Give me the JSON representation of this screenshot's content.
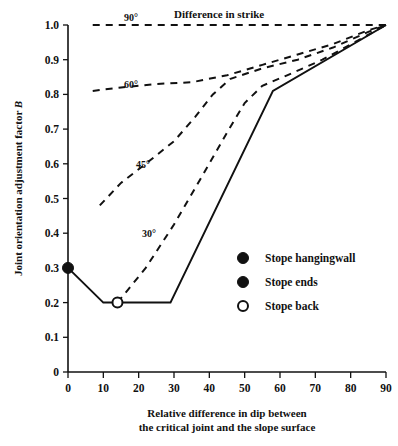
{
  "chart_data": {
    "type": "line",
    "title": "",
    "xlabel": "Relative difference in dip between\nthe critical joint and the slope surface",
    "ylabel": "Joint orientation adjustment factor B",
    "xlim": [
      0,
      90
    ],
    "ylim": [
      0,
      1.0
    ],
    "xticks": [
      "0",
      "10",
      "20",
      "30",
      "40",
      "50",
      "60",
      "70",
      "80",
      "90"
    ],
    "yticks": [
      "0",
      "0.1",
      "0.2",
      "0.3",
      "0.4",
      "0.5",
      "0.6",
      "0.7",
      "0.8",
      "0.9",
      "1.0"
    ],
    "grid": false,
    "annotation": "Difference in strike",
    "series": [
      {
        "name": "90°",
        "label": "90°",
        "style": "dashed",
        "x": [
          7,
          20,
          40,
          60,
          75,
          85,
          90
        ],
        "y": [
          1.0,
          1.0,
          1.0,
          1.0,
          1.0,
          1.0,
          1.0
        ]
      },
      {
        "name": "60°",
        "label": "60°",
        "style": "dashed",
        "x": [
          7,
          15,
          25,
          35,
          45,
          55,
          65,
          75,
          85,
          90
        ],
        "y": [
          0.81,
          0.82,
          0.83,
          0.835,
          0.855,
          0.885,
          0.915,
          0.945,
          0.985,
          1.0
        ]
      },
      {
        "name": "45°",
        "label": "45°",
        "style": "dashed",
        "x": [
          9,
          15,
          22,
          30,
          36,
          41,
          46,
          55,
          65,
          75,
          85,
          90
        ],
        "y": [
          0.48,
          0.545,
          0.6,
          0.665,
          0.735,
          0.8,
          0.845,
          0.875,
          0.9,
          0.935,
          0.98,
          1.0
        ]
      },
      {
        "name": "30°",
        "label": "30°",
        "style": "dashed",
        "x": [
          14,
          22,
          30,
          38,
          45,
          50,
          55,
          62,
          72,
          82,
          90
        ],
        "y": [
          0.2,
          0.3,
          0.425,
          0.565,
          0.69,
          0.775,
          0.825,
          0.855,
          0.9,
          0.955,
          1.0
        ]
      },
      {
        "name": "stope-outline",
        "label": "",
        "style": "solid",
        "x": [
          0,
          10,
          29,
          58,
          90
        ],
        "y": [
          0.3,
          0.2,
          0.2,
          0.81,
          1.0
        ]
      }
    ],
    "markers": [
      {
        "name": "stope-hangingwall-point",
        "x": 0,
        "y": 0.3,
        "style": "filled"
      },
      {
        "name": "stope-back-point",
        "x": 14,
        "y": 0.2,
        "style": "open"
      }
    ]
  },
  "legend": {
    "position": "inside-right-lower",
    "items": [
      {
        "marker": "filled",
        "label": "Stope hangingwall"
      },
      {
        "marker": "filled",
        "label": "Stope ends"
      },
      {
        "marker": "open",
        "label": "Stope back"
      }
    ]
  },
  "xaxis_caption": {
    "line1": "Relative difference in dip between",
    "line2": "the critical joint and the slope surface"
  },
  "yaxis_caption": {
    "text_plain": "Joint orientation adjustment factor ",
    "text_italic": "B"
  },
  "colors": {
    "ink": "#111111",
    "paper": "#ffffff"
  }
}
